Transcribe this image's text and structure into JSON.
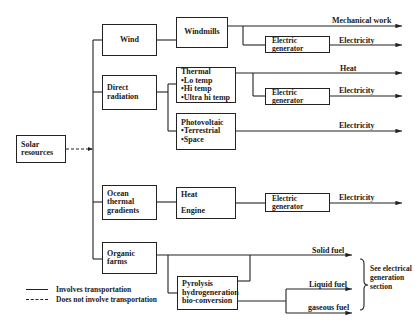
{
  "diagram": {
    "root": {
      "label": "Solar resources"
    },
    "sources": [
      {
        "label": "Wind"
      },
      {
        "label": "Direct radiation"
      },
      {
        "label": "Ocean thermal gradients"
      },
      {
        "label": "Organic farms"
      }
    ],
    "converters": {
      "windmills": "Windmills",
      "thermal": {
        "title": "Thermal",
        "items": [
          "•Lo temp",
          "•Hi temp",
          "•Ultra hi temp"
        ]
      },
      "photovoltaic": {
        "title": "Photovoltaic",
        "items": [
          "•Terrestrial",
          "•Space"
        ]
      },
      "heat_engine": {
        "line1": "Heat",
        "line2": "Engine"
      },
      "pyrolysis": {
        "lines": [
          "Pyrolysis",
          "hydrogeneration",
          "bio-conversion"
        ]
      },
      "electric_generator": "Electric generator"
    },
    "outputs": {
      "mechanical_work": "Mechanical work",
      "electricity": "Electricity",
      "heat": "Heat",
      "solid_fuel": "Solid fuel",
      "liquid_fuel": "Liquid fuel",
      "gaseous_fuel": "gaseous fuel"
    },
    "note": "See electrical generation section",
    "legend": {
      "solid": "Involves transportation",
      "dashed": "Does not involve transportation"
    }
  }
}
